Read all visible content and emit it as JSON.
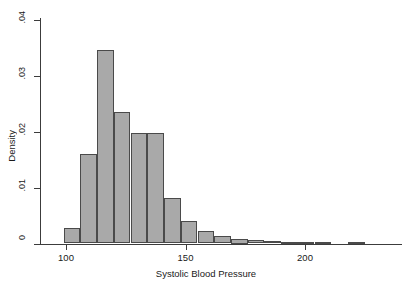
{
  "chart_data": {
    "type": "bar",
    "title": "",
    "subtitle": "",
    "xlabel": "Systolic Blood Pressure",
    "ylabel": "Density",
    "xlim": [
      96,
      255
    ],
    "ylim": [
      0,
      0.042
    ],
    "grid": false,
    "legend": null,
    "bin_width": 7,
    "x_ticks": [
      100,
      150,
      200,
      250
    ],
    "x_tick_labels": [
      "100",
      "150",
      "200",
      "250"
    ],
    "y_ticks": [
      0,
      0.01,
      0.02,
      0.03,
      0.04
    ],
    "y_tick_labels": [
      "0",
      ".01",
      ".02",
      ".03",
      ".04"
    ],
    "bin_edges": [
      99,
      106,
      113,
      120,
      127,
      134,
      141,
      148,
      155,
      162,
      169,
      176,
      183,
      190,
      197,
      204,
      211,
      218,
      225
    ],
    "categories": [
      "99-106",
      "106-113",
      "113-120",
      "120-127",
      "127-134",
      "134-141",
      "141-148",
      "148-155",
      "155-162",
      "162-169",
      "169-176",
      "176-183",
      "183-190",
      "190-197",
      "197-204",
      "204-211",
      "218-225"
    ],
    "values": [
      0.0028,
      0.016,
      0.0347,
      0.0236,
      0.0198,
      0.0198,
      0.0082,
      0.004,
      0.0023,
      0.0013,
      0.0009,
      0.0006,
      0.0004,
      0.0003,
      0.0002,
      0.0001,
      0.0002
    ],
    "bars": [
      {
        "x0": 99,
        "x1": 106,
        "density": 0.0028
      },
      {
        "x0": 106,
        "x1": 113,
        "density": 0.016
      },
      {
        "x0": 113,
        "x1": 120,
        "density": 0.0347
      },
      {
        "x0": 120,
        "x1": 127,
        "density": 0.0236
      },
      {
        "x0": 127,
        "x1": 134,
        "density": 0.0198
      },
      {
        "x0": 134,
        "x1": 141,
        "density": 0.0198
      },
      {
        "x0": 141,
        "x1": 148,
        "density": 0.0082
      },
      {
        "x0": 148,
        "x1": 155,
        "density": 0.004
      },
      {
        "x0": 155,
        "x1": 162,
        "density": 0.0023
      },
      {
        "x0": 162,
        "x1": 169,
        "density": 0.0013
      },
      {
        "x0": 169,
        "x1": 176,
        "density": 0.0009
      },
      {
        "x0": 176,
        "x1": 183,
        "density": 0.0006
      },
      {
        "x0": 183,
        "x1": 190,
        "density": 0.0004
      },
      {
        "x0": 190,
        "x1": 197,
        "density": 0.0003
      },
      {
        "x0": 197,
        "x1": 204,
        "density": 0.0002
      },
      {
        "x0": 204,
        "x1": 211,
        "density": 0.0001
      },
      {
        "x0": 218,
        "x1": 225,
        "density": 0.0002
      }
    ],
    "colors": {
      "bar_fill": "#a9a9a9",
      "bar_border": "#4a4a4a",
      "axis": "#3c3c3c",
      "text": "#1a1a1a",
      "background": "#ffffff"
    }
  }
}
